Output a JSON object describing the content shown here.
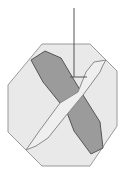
{
  "diagram": {
    "title": "",
    "colors": {
      "background": "#ffffff",
      "octagon_fill": "#e9e9e9",
      "octagon_stroke": "#9a9a9a",
      "dark_band_fill": "#9b9b9b",
      "dark_band_stroke": "#555555",
      "light_band_fill": "#efefef",
      "light_band_stroke": "#8a8a8a",
      "pointer_stroke": "#555555"
    },
    "shapes": {
      "octagon": "42,44 90,44 117,71 117,126 90,166 42,166 8,132 8,85",
      "dark_band": "31,60 45,51 61,58 83,95 100,122 103,148 91,154 74,131 66,110 60,103 43,82",
      "light_band": "26,150 36,146 48,138 64,118 83,95 100,72 103,65 106,60 94,62 86,72 78,92 60,103 40,130",
      "pointer_line": {
        "x1": 74,
        "y1": 8,
        "x2": 74,
        "y2": 77
      },
      "pointer_tick": {
        "x1": 70,
        "y1": 77,
        "x2": 87,
        "y2": 77
      }
    }
  }
}
